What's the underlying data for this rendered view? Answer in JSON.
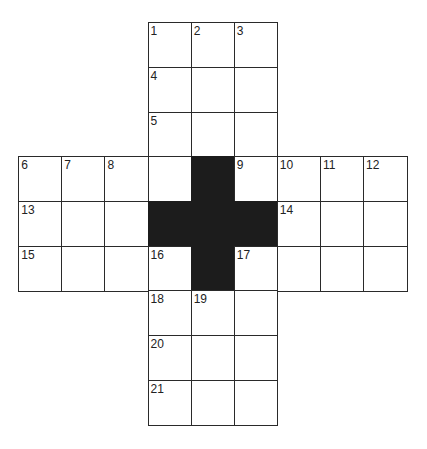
{
  "puzzle": {
    "type": "crossword",
    "rows": 9,
    "cols": 9,
    "origin": {
      "x": 19,
      "y": 23
    },
    "cell_w": 43.1,
    "cell_h": 44.7,
    "colors": {
      "line": "#2a2a2a",
      "block": "#1c1c1c",
      "background": "#ffffff"
    },
    "cells": [
      {
        "r": 0,
        "c": 3,
        "n": "1"
      },
      {
        "r": 0,
        "c": 4,
        "n": "2"
      },
      {
        "r": 0,
        "c": 5,
        "n": "3"
      },
      {
        "r": 1,
        "c": 3,
        "n": "4"
      },
      {
        "r": 1,
        "c": 4,
        "n": ""
      },
      {
        "r": 1,
        "c": 5,
        "n": ""
      },
      {
        "r": 2,
        "c": 3,
        "n": "5"
      },
      {
        "r": 2,
        "c": 4,
        "n": ""
      },
      {
        "r": 2,
        "c": 5,
        "n": ""
      },
      {
        "r": 3,
        "c": 0,
        "n": "6"
      },
      {
        "r": 3,
        "c": 1,
        "n": "7"
      },
      {
        "r": 3,
        "c": 2,
        "n": "8"
      },
      {
        "r": 3,
        "c": 3,
        "n": ""
      },
      {
        "r": 3,
        "c": 4,
        "n": "",
        "black": true
      },
      {
        "r": 3,
        "c": 5,
        "n": "9"
      },
      {
        "r": 3,
        "c": 6,
        "n": "10"
      },
      {
        "r": 3,
        "c": 7,
        "n": "11"
      },
      {
        "r": 3,
        "c": 8,
        "n": "12"
      },
      {
        "r": 4,
        "c": 0,
        "n": "13"
      },
      {
        "r": 4,
        "c": 1,
        "n": ""
      },
      {
        "r": 4,
        "c": 2,
        "n": ""
      },
      {
        "r": 4,
        "c": 3,
        "n": "",
        "black": true
      },
      {
        "r": 4,
        "c": 4,
        "n": "",
        "black": true
      },
      {
        "r": 4,
        "c": 5,
        "n": "",
        "black": true
      },
      {
        "r": 4,
        "c": 6,
        "n": "14"
      },
      {
        "r": 4,
        "c": 7,
        "n": ""
      },
      {
        "r": 4,
        "c": 8,
        "n": ""
      },
      {
        "r": 5,
        "c": 0,
        "n": "15"
      },
      {
        "r": 5,
        "c": 1,
        "n": ""
      },
      {
        "r": 5,
        "c": 2,
        "n": ""
      },
      {
        "r": 5,
        "c": 3,
        "n": "16"
      },
      {
        "r": 5,
        "c": 4,
        "n": "",
        "black": true
      },
      {
        "r": 5,
        "c": 5,
        "n": "17"
      },
      {
        "r": 5,
        "c": 6,
        "n": ""
      },
      {
        "r": 5,
        "c": 7,
        "n": ""
      },
      {
        "r": 5,
        "c": 8,
        "n": ""
      },
      {
        "r": 6,
        "c": 3,
        "n": "18"
      },
      {
        "r": 6,
        "c": 4,
        "n": "19"
      },
      {
        "r": 6,
        "c": 5,
        "n": ""
      },
      {
        "r": 7,
        "c": 3,
        "n": "20"
      },
      {
        "r": 7,
        "c": 4,
        "n": ""
      },
      {
        "r": 7,
        "c": 5,
        "n": ""
      },
      {
        "r": 8,
        "c": 3,
        "n": "21"
      },
      {
        "r": 8,
        "c": 4,
        "n": ""
      },
      {
        "r": 8,
        "c": 5,
        "n": ""
      }
    ]
  }
}
